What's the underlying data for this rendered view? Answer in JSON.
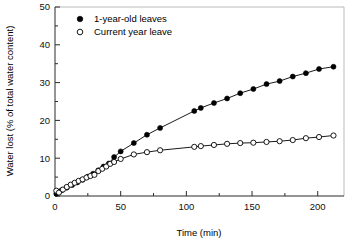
{
  "chart_data": {
    "type": "scatter",
    "title": "",
    "xlabel": "Time (min)",
    "ylabel": "Water lost (% of total water content)",
    "xlim": [
      0,
      220
    ],
    "ylim": [
      0,
      50
    ],
    "xticks": [
      0,
      50,
      100,
      150,
      200
    ],
    "xtick_labels": [
      "0",
      "50",
      "100",
      "150",
      "200"
    ],
    "xminor_ticks": [
      25,
      75,
      125,
      175
    ],
    "yticks": [
      0,
      10,
      20,
      30,
      40,
      50
    ],
    "ytick_labels": [
      "0",
      "10",
      "20",
      "30",
      "40",
      "50"
    ],
    "yminor_ticks": [
      5,
      15,
      25,
      35,
      45
    ],
    "grid": false,
    "legend_position": "top-left-inside",
    "series": [
      {
        "name": "1-year-old leaves",
        "marker": "filled-circle",
        "color": "#000000",
        "x": [
          1,
          5,
          9,
          13,
          17,
          21,
          25,
          29,
          33,
          37,
          41,
          45,
          50,
          60,
          70,
          80,
          106,
          111,
          121,
          131,
          141,
          151,
          161,
          171,
          181,
          191,
          201,
          212
        ],
        "y": [
          0.6,
          1.5,
          2.2,
          2.9,
          3.6,
          4.3,
          5.1,
          5.9,
          6.8,
          7.8,
          8.6,
          10.3,
          11.8,
          14.0,
          16.2,
          18.0,
          22.5,
          23.3,
          24.6,
          25.8,
          27.2,
          28.3,
          29.6,
          30.4,
          31.6,
          32.5,
          33.6,
          34.2
        ]
      },
      {
        "name": "Current year leave",
        "marker": "open-circle",
        "color": "#000000",
        "x": [
          1,
          3,
          6,
          9,
          12,
          15,
          18,
          21,
          24,
          27,
          30,
          33,
          36,
          39,
          42,
          45,
          50,
          60,
          70,
          80,
          106,
          111,
          121,
          131,
          141,
          151,
          161,
          171,
          181,
          191,
          201,
          212
        ],
        "y": [
          1.4,
          0.9,
          1.7,
          2.4,
          3.0,
          3.5,
          4.0,
          4.4,
          4.9,
          5.3,
          5.6,
          6.6,
          7.2,
          7.8,
          8.5,
          9.0,
          9.8,
          11.0,
          11.6,
          12.1,
          13.0,
          13.2,
          13.5,
          13.8,
          14.0,
          14.1,
          14.3,
          14.5,
          14.8,
          15.3,
          15.6,
          16.0
        ]
      }
    ],
    "legend": [
      {
        "label": "1-year-old leaves",
        "marker": "filled-circle"
      },
      {
        "label": "Current year leave",
        "marker": "open-circle"
      }
    ]
  }
}
